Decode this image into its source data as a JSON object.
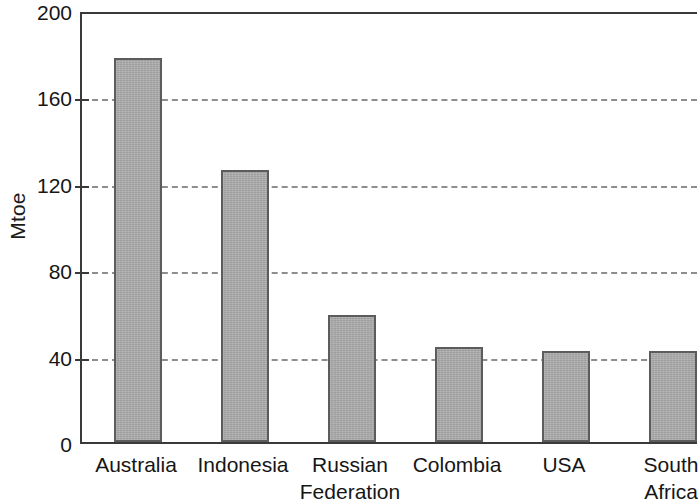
{
  "chart_data": {
    "type": "bar",
    "title": "",
    "subtitle": "",
    "xlabel": "",
    "ylabel": "Mtoe",
    "categories": [
      "Australia",
      "Indonesia",
      "Russian Federation",
      "Colombia",
      "USA",
      "South Africa"
    ],
    "values": [
      178,
      126,
      59,
      44,
      42,
      42
    ],
    "ylim": [
      0,
      200
    ],
    "y_ticks": [
      0,
      40,
      80,
      120,
      160,
      200
    ],
    "y_tick_labels": [
      "0",
      "40",
      "80",
      "120",
      "160",
      "200"
    ],
    "gridlines": {
      "y_values": [
        40,
        80,
        120,
        160
      ],
      "style": "dashed",
      "color": "#8e8e8e",
      "x_grid": false
    },
    "legend": {
      "visible": false,
      "position": "none",
      "entries": []
    },
    "bar_style": {
      "fill_color": "#a9a9a9",
      "edge_color": "#5c5c5c"
    },
    "axis_color": "#3a3a3a",
    "background_color": "#ffffff"
  },
  "axis": {
    "y_title": "Mtoe"
  }
}
